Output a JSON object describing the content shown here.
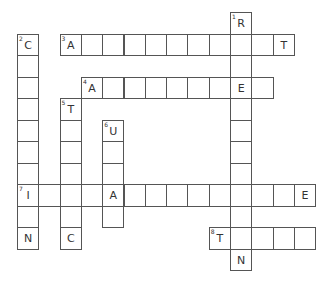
{
  "puzzle": {
    "type": "crossword",
    "grid": {
      "origin_x": 17,
      "origin_y": 12,
      "cell_w": 21.3,
      "cell_h": 21.5,
      "border_color": "#555555"
    },
    "entries": [
      {
        "number": 1,
        "direction": "down",
        "row": 0,
        "col": 10,
        "length": 12,
        "letters": {
          "0": "R",
          "11": "N"
        }
      },
      {
        "number": 2,
        "direction": "down",
        "row": 1,
        "col": 0,
        "length": 10,
        "letters": {
          "0": "C",
          "7": "I",
          "9": "N"
        }
      },
      {
        "number": 3,
        "direction": "across",
        "row": 1,
        "col": 2,
        "length": 11,
        "letters": {
          "0": "A",
          "10": "T"
        }
      },
      {
        "number": 4,
        "direction": "across",
        "row": 3,
        "col": 3,
        "length": 9,
        "letters": {
          "0": "A",
          "7": "E"
        }
      },
      {
        "number": 5,
        "direction": "down",
        "row": 4,
        "col": 2,
        "length": 7,
        "letters": {
          "0": "T",
          "6": "C"
        }
      },
      {
        "number": 6,
        "direction": "down",
        "row": 5,
        "col": 4,
        "length": 5,
        "letters": {
          "0": "U",
          "3": "A"
        }
      },
      {
        "number": 7,
        "direction": "across",
        "row": 8,
        "col": 0,
        "length": 14,
        "letters": {
          "0": "I",
          "4": "A",
          "13": "E"
        }
      },
      {
        "number": 8,
        "direction": "across",
        "row": 10,
        "col": 9,
        "length": 5,
        "letters": {
          "0": "T"
        }
      }
    ]
  }
}
